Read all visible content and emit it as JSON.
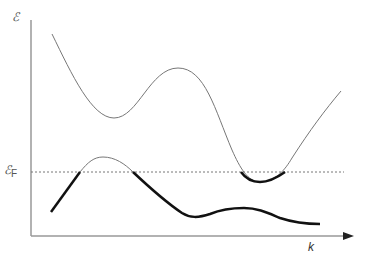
{
  "diagram": {
    "title": "",
    "y_axis_label": "ℰ",
    "fermi_label_main": "ℰ",
    "fermi_label_sub": "F",
    "x_axis_label": "k",
    "curves": [
      {
        "name": "upper-band",
        "style": "thin gray",
        "shape": "descends, local min, local max, deep min dipping below Fermi level, rises"
      },
      {
        "name": "lower-band",
        "style": "thick black below Fermi level, thin above",
        "shape": "rises to peak above Fermi level, descends, shallow plateau, descends"
      }
    ],
    "fermi_level": {
      "style": "dotted horizontal line"
    },
    "colors": {
      "axis": "#888888",
      "thin_curve": "#777777",
      "thick_curve": "#111111",
      "fermi_line": "#777777"
    }
  }
}
